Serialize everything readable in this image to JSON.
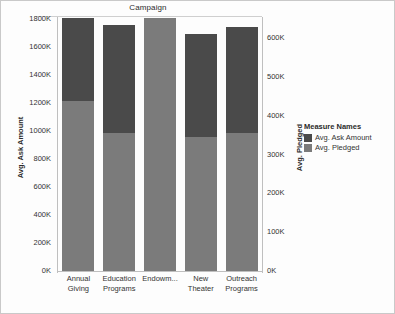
{
  "chart_data": {
    "type": "bar",
    "stacked": true,
    "title": "Campaign",
    "xlabel": "",
    "ylabel": "Avg. Ask Amount",
    "ylabel_right": "Avg. Pledged",
    "grid": false,
    "legend_position": "right",
    "categories": [
      "Annual Giving",
      "Education Programs",
      "Endowm...",
      "New Theater",
      "Outreach Programs"
    ],
    "category_lines": [
      [
        "Annual",
        "Giving"
      ],
      [
        "Education",
        "Programs"
      ],
      [
        "Endowm...",
        ""
      ],
      [
        "New",
        "Theater"
      ],
      [
        "Outreach",
        "Programs"
      ]
    ],
    "series": [
      {
        "name": "Avg. Ask Amount",
        "color": "#4a4a4a",
        "values": [
          590000,
          770000,
          0,
          735000,
          755000
        ]
      },
      {
        "name": "Avg. Pledged",
        "color": "#7b7b7b",
        "values": [
          1217000,
          987000,
          1807000,
          957000,
          987000
        ]
      }
    ],
    "totals": [
      1807000,
      1757000,
      1807000,
      1692000,
      1742000
    ],
    "yaxis_left": {
      "label": "Avg. Ask Amount",
      "min": 0,
      "max": 1800000,
      "step": 200000,
      "ticks": [
        "1800K",
        "1600K",
        "1400K",
        "1200K",
        "1000K",
        "800K",
        "600K",
        "400K",
        "200K",
        "0K"
      ],
      "tick_values": [
        1800000,
        1600000,
        1400000,
        1200000,
        1000000,
        800000,
        600000,
        400000,
        200000,
        0
      ]
    },
    "yaxis_right": {
      "label": "Avg. Pledged",
      "min": 0,
      "max": 650000,
      "step": 100000,
      "ticks": [
        "600K",
        "500K",
        "400K",
        "300K",
        "200K",
        "100K",
        "0K"
      ],
      "tick_values": [
        600000,
        500000,
        400000,
        300000,
        200000,
        100000,
        0
      ]
    },
    "legend": {
      "title": "Measure Names",
      "entries": [
        {
          "label": "Avg. Ask Amount",
          "color": "#4a4a4a"
        },
        {
          "label": "Avg. Pledged",
          "color": "#7b7b7b"
        }
      ]
    }
  }
}
